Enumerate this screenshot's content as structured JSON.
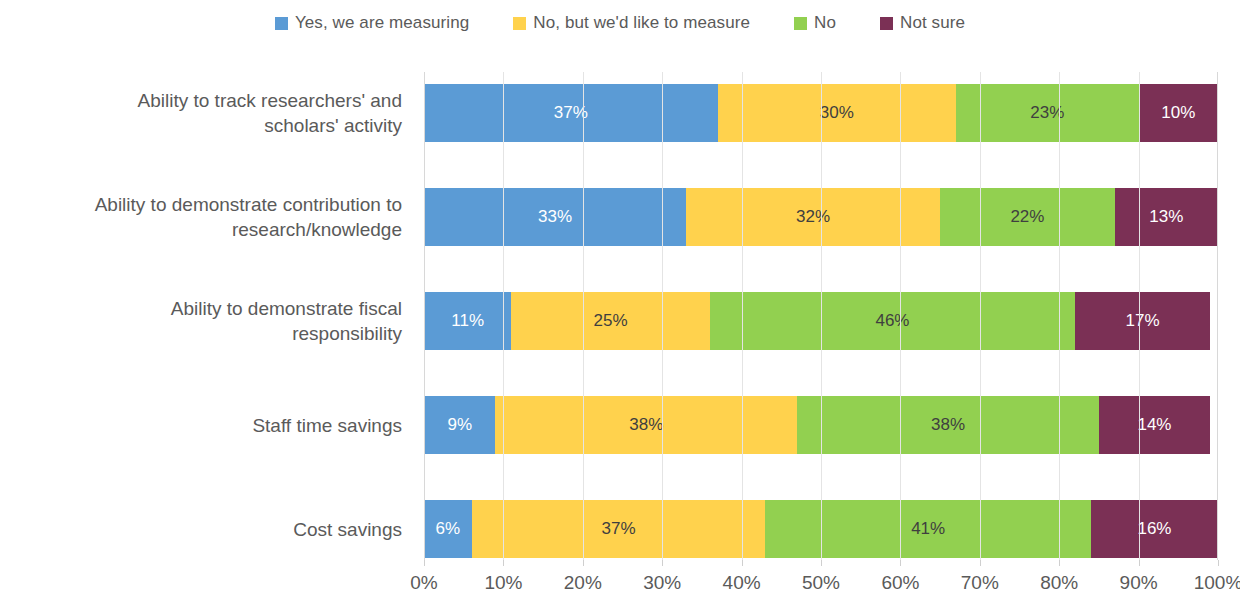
{
  "legend": {
    "position": "top",
    "items": [
      {
        "label": "Yes, we are measuring",
        "color": "#5B9BD5",
        "icon": "square-swatch-icon"
      },
      {
        "label": "No, but we'd like to measure",
        "color": "#FFD24D",
        "icon": "square-swatch-icon"
      },
      {
        "label": "No",
        "color": "#92D050",
        "icon": "square-swatch-icon"
      },
      {
        "label": "Not sure",
        "color": "#7B3055",
        "icon": "square-swatch-icon"
      }
    ]
  },
  "axis": {
    "x_ticks": [
      "0%",
      "10%",
      "20%",
      "30%",
      "40%",
      "50%",
      "60%",
      "70%",
      "80%",
      "90%",
      "100%"
    ],
    "x_min": 0,
    "x_max": 100
  },
  "rows": [
    {
      "category_lines": [
        "Ability to track researchers' and",
        "scholars' activity"
      ],
      "segments": [
        {
          "series": "Yes, we are measuring",
          "value": 37,
          "label": "37%",
          "color": "#5B9BD5",
          "text": "light"
        },
        {
          "series": "No, but we'd like to measure",
          "value": 30,
          "label": "30%",
          "color": "#FFD24D",
          "text": "dark"
        },
        {
          "series": "No",
          "value": 23,
          "label": "23%",
          "color": "#92D050",
          "text": "dark"
        },
        {
          "series": "Not sure",
          "value": 10,
          "label": "10%",
          "color": "#7B3055",
          "text": "light"
        }
      ]
    },
    {
      "category_lines": [
        "Ability to demonstrate contribution to",
        "research/knowledge"
      ],
      "segments": [
        {
          "series": "Yes, we are measuring",
          "value": 33,
          "label": "33%",
          "color": "#5B9BD5",
          "text": "light"
        },
        {
          "series": "No, but we'd like to measure",
          "value": 32,
          "label": "32%",
          "color": "#FFD24D",
          "text": "dark"
        },
        {
          "series": "No",
          "value": 22,
          "label": "22%",
          "color": "#92D050",
          "text": "dark"
        },
        {
          "series": "Not sure",
          "value": 13,
          "label": "13%",
          "color": "#7B3055",
          "text": "light"
        }
      ]
    },
    {
      "category_lines": [
        "Ability to demonstrate fiscal",
        "responsibility"
      ],
      "segments": [
        {
          "series": "Yes, we are measuring",
          "value": 11,
          "label": "11%",
          "color": "#5B9BD5",
          "text": "light"
        },
        {
          "series": "No, but we'd like to measure",
          "value": 25,
          "label": "25%",
          "color": "#FFD24D",
          "text": "dark"
        },
        {
          "series": "No",
          "value": 46,
          "label": "46%",
          "color": "#92D050",
          "text": "dark"
        },
        {
          "series": "Not sure",
          "value": 17,
          "label": "17%",
          "color": "#7B3055",
          "text": "light"
        }
      ]
    },
    {
      "category_lines": [
        "Staff time savings"
      ],
      "segments": [
        {
          "series": "Yes, we are measuring",
          "value": 9,
          "label": "9%",
          "color": "#5B9BD5",
          "text": "light"
        },
        {
          "series": "No, but we'd like to measure",
          "value": 38,
          "label": "38%",
          "color": "#FFD24D",
          "text": "dark"
        },
        {
          "series": "No",
          "value": 38,
          "label": "38%",
          "color": "#92D050",
          "text": "dark"
        },
        {
          "series": "Not sure",
          "value": 14,
          "label": "14%",
          "color": "#7B3055",
          "text": "light"
        }
      ]
    },
    {
      "category_lines": [
        "Cost savings"
      ],
      "segments": [
        {
          "series": "Yes, we are measuring",
          "value": 6,
          "label": "6%",
          "color": "#5B9BD5",
          "text": "light"
        },
        {
          "series": "No, but we'd like to measure",
          "value": 37,
          "label": "37%",
          "color": "#FFD24D",
          "text": "dark"
        },
        {
          "series": "No",
          "value": 41,
          "label": "41%",
          "color": "#92D050",
          "text": "dark"
        },
        {
          "series": "Not sure",
          "value": 16,
          "label": "16%",
          "color": "#7B3055",
          "text": "light"
        }
      ]
    }
  ],
  "chart_data": {
    "type": "bar",
    "orientation": "horizontal",
    "stacked": true,
    "normalized_percent": true,
    "title": "",
    "subtitle": "",
    "xlabel": "",
    "ylabel": "",
    "xlim": [
      0,
      100
    ],
    "xticks": [
      0,
      10,
      20,
      30,
      40,
      50,
      60,
      70,
      80,
      90,
      100
    ],
    "xtick_labels": [
      "0%",
      "10%",
      "20%",
      "30%",
      "40%",
      "50%",
      "60%",
      "70%",
      "80%",
      "90%",
      "100%"
    ],
    "grid": "vertical",
    "legend_position": "top",
    "categories": [
      "Ability to track researchers' and scholars' activity",
      "Ability to demonstrate contribution to research/knowledge",
      "Ability to demonstrate fiscal responsibility",
      "Staff time savings",
      "Cost savings"
    ],
    "series": [
      {
        "name": "Yes, we are measuring",
        "color": "#5B9BD5",
        "values": [
          37,
          33,
          11,
          9,
          6
        ]
      },
      {
        "name": "No, but we'd like to measure",
        "color": "#FFD24D",
        "values": [
          30,
          32,
          25,
          38,
          37
        ]
      },
      {
        "name": "No",
        "color": "#92D050",
        "values": [
          23,
          22,
          46,
          38,
          41
        ]
      },
      {
        "name": "Not sure",
        "color": "#7B3055",
        "values": [
          10,
          13,
          17,
          14,
          16
        ]
      }
    ],
    "data_labels": [
      [
        "37%",
        "30%",
        "23%",
        "10%"
      ],
      [
        "33%",
        "32%",
        "22%",
        "13%"
      ],
      [
        "11%",
        "25%",
        "46%",
        "17%"
      ],
      [
        "9%",
        "38%",
        "38%",
        "14%"
      ],
      [
        "6%",
        "37%",
        "41%",
        "16%"
      ]
    ]
  }
}
